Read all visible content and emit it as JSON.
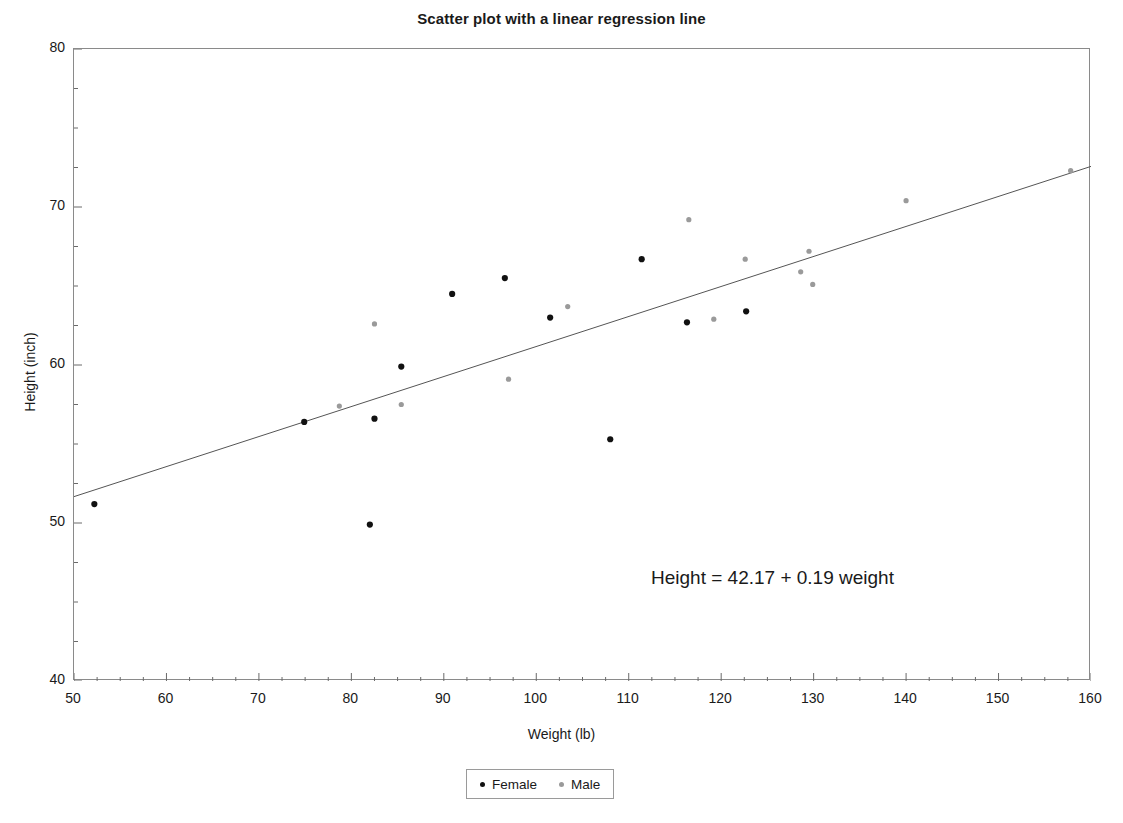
{
  "chart_data": {
    "type": "scatter",
    "title": "Scatter plot with a linear regression line",
    "xlabel": "Weight (lb)",
    "ylabel": "Height (inch)",
    "xlim": [
      50,
      160
    ],
    "ylim": [
      40,
      80
    ],
    "xticks": [
      50,
      60,
      70,
      80,
      90,
      100,
      110,
      120,
      130,
      140,
      150,
      160
    ],
    "yticks": [
      40,
      50,
      60,
      70,
      80
    ],
    "x_minor_tick_step": 2.5,
    "y_minor_tick_step": 2.5,
    "grid": false,
    "legend_position": "bottom-center",
    "annotations": [
      {
        "text": "Height = 42.17 + 0.19 weight",
        "x": 112,
        "y": 45.9
      }
    ],
    "regression_line": {
      "intercept": 42.17,
      "slope": 0.19,
      "x_start": 50,
      "x_end": 160,
      "color": "#555555",
      "width": 1
    },
    "series": [
      {
        "name": "Female",
        "color": "#111111",
        "marker": "circle",
        "marker_size": 5,
        "points": [
          [
            52.2,
            51.2
          ],
          [
            74.9,
            56.4
          ],
          [
            82.0,
            49.9
          ],
          [
            82.5,
            56.6
          ],
          [
            85.4,
            59.9
          ],
          [
            90.9,
            64.5
          ],
          [
            96.6,
            65.5
          ],
          [
            101.5,
            63.0
          ],
          [
            108.0,
            55.3
          ],
          [
            111.4,
            66.7
          ],
          [
            116.3,
            62.7
          ],
          [
            122.7,
            63.4
          ]
        ]
      },
      {
        "name": "Male",
        "color": "#9a9a9a",
        "marker": "circle",
        "marker_size": 4,
        "points": [
          [
            78.7,
            57.4
          ],
          [
            82.5,
            62.6
          ],
          [
            85.4,
            57.5
          ],
          [
            97.0,
            59.1
          ],
          [
            103.4,
            63.7
          ],
          [
            116.5,
            69.2
          ],
          [
            119.2,
            62.9
          ],
          [
            122.6,
            66.7
          ],
          [
            128.6,
            65.9
          ],
          [
            129.5,
            67.2
          ],
          [
            129.9,
            65.1
          ],
          [
            140.0,
            70.4
          ],
          [
            157.8,
            72.3
          ]
        ]
      }
    ]
  },
  "legend": {
    "entries": [
      {
        "label": "Female",
        "color": "#111111"
      },
      {
        "label": "Male",
        "color": "#9a9a9a"
      }
    ]
  }
}
